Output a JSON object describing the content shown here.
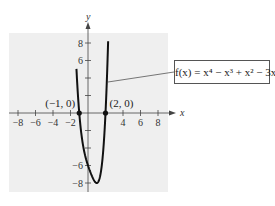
{
  "chart_data": {
    "type": "line",
    "title": "",
    "function_label": "f(x) = x⁴ − x³ + x² − 3x − 6",
    "function": "x^4 - x^3 + x^2 - 3x - 6",
    "xlabel": "x",
    "ylabel": "y",
    "xlim": [
      -9,
      9
    ],
    "ylim": [
      -9,
      9
    ],
    "x_ticks": [
      -8,
      -6,
      -4,
      -2,
      0,
      2,
      4,
      6,
      8
    ],
    "x_tick_labels": [
      "−8",
      "−6",
      "−4",
      "−2",
      "4",
      "6",
      "8"
    ],
    "y_ticks": [
      -8,
      -6,
      -4,
      -2,
      2,
      4,
      6,
      8
    ],
    "y_tick_labels": [
      "8",
      "6",
      "−6",
      "−8"
    ],
    "grid": false,
    "background": "#efefef",
    "line_color": "#111111",
    "points": [
      {
        "x": -1,
        "y": 0,
        "label": "(−1, 0)"
      },
      {
        "x": 2,
        "y": 0,
        "label": "(2, 0)"
      }
    ],
    "series": [
      {
        "name": "f(x)",
        "x": [
          -1.3,
          -1.2,
          -1.0,
          -0.8,
          -0.5,
          0,
          0.5,
          1.0,
          1.1,
          1.5,
          2.0,
          2.2,
          2.35
        ],
        "y": [
          7.0,
          4.2,
          0,
          -2.4,
          -4.8,
          -6,
          -7.31,
          -8,
          -7.99,
          -6.94,
          0,
          4.5,
          8.6
        ]
      }
    ]
  }
}
